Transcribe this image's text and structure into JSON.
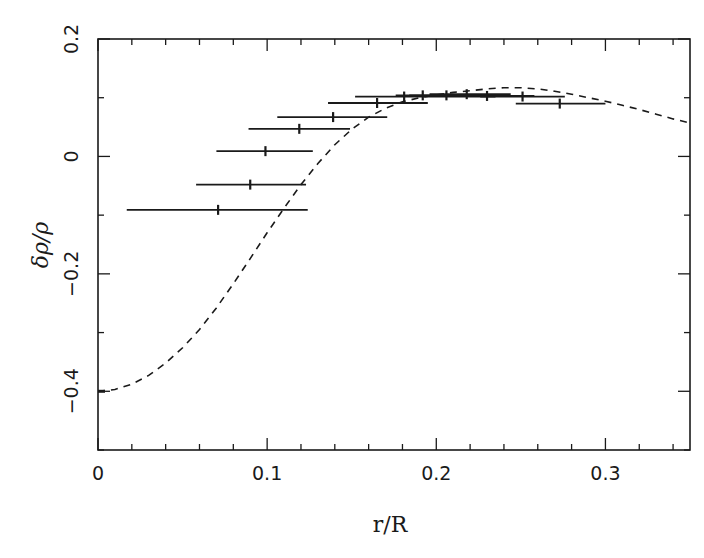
{
  "chart_data": {
    "type": "scatter",
    "title": "",
    "xlabel": "r/R",
    "ylabel": "δρ/ρ",
    "xlim": [
      0,
      0.35
    ],
    "ylim": [
      -0.5,
      0.2
    ],
    "grid": false,
    "legend": null,
    "x_ticks": [
      0,
      0.1,
      0.2,
      0.3
    ],
    "x_tick_labels": [
      "0",
      "0.1",
      "0.2",
      "0.3"
    ],
    "x_minor_step": 0.02,
    "y_ticks": [
      -0.4,
      -0.2,
      0,
      0.2
    ],
    "y_tick_labels": [
      "−0.4",
      "−0.2",
      "0",
      "0.2"
    ],
    "y_minor_step": 0.1,
    "series": [
      {
        "name": "inversion points (horizontal error bars)",
        "kind": "errorbar",
        "color": "#1a1a1a",
        "points": [
          {
            "x": 0.071,
            "y": -0.091,
            "xmin": 0.017,
            "xmax": 0.124
          },
          {
            "x": 0.09,
            "y": -0.048,
            "xmin": 0.058,
            "xmax": 0.123
          },
          {
            "x": 0.099,
            "y": 0.009,
            "xmin": 0.07,
            "xmax": 0.127
          },
          {
            "x": 0.119,
            "y": 0.047,
            "xmin": 0.089,
            "xmax": 0.149
          },
          {
            "x": 0.139,
            "y": 0.067,
            "xmin": 0.106,
            "xmax": 0.171
          },
          {
            "x": 0.165,
            "y": 0.091,
            "xmin": 0.136,
            "xmax": 0.195
          },
          {
            "x": 0.181,
            "y": 0.102,
            "xmin": 0.152,
            "xmax": 0.235
          },
          {
            "x": 0.192,
            "y": 0.104,
            "xmin": 0.176,
            "xmax": 0.222
          },
          {
            "x": 0.206,
            "y": 0.104,
            "xmin": 0.184,
            "xmax": 0.232
          },
          {
            "x": 0.218,
            "y": 0.106,
            "xmin": 0.196,
            "xmax": 0.244
          },
          {
            "x": 0.23,
            "y": 0.103,
            "xmin": 0.208,
            "xmax": 0.258
          },
          {
            "x": 0.251,
            "y": 0.102,
            "xmin": 0.226,
            "xmax": 0.276
          },
          {
            "x": 0.273,
            "y": 0.09,
            "xmin": 0.247,
            "xmax": 0.3
          }
        ]
      },
      {
        "name": "model curve",
        "kind": "line",
        "style": "dashed",
        "color": "#1a1a1a",
        "x": [
          0.0,
          0.01,
          0.02,
          0.03,
          0.04,
          0.05,
          0.06,
          0.07,
          0.08,
          0.09,
          0.1,
          0.11,
          0.12,
          0.13,
          0.14,
          0.15,
          0.16,
          0.17,
          0.18,
          0.19,
          0.2,
          0.21,
          0.22,
          0.23,
          0.24,
          0.25,
          0.26,
          0.27,
          0.28,
          0.29,
          0.3,
          0.31,
          0.32,
          0.33,
          0.34,
          0.35
        ],
        "y": [
          -0.4,
          -0.397,
          -0.388,
          -0.373,
          -0.352,
          -0.326,
          -0.295,
          -0.258,
          -0.217,
          -0.174,
          -0.13,
          -0.088,
          -0.048,
          -0.012,
          0.02,
          0.046,
          0.067,
          0.082,
          0.093,
          0.1,
          0.105,
          0.109,
          0.112,
          0.115,
          0.117,
          0.117,
          0.115,
          0.111,
          0.106,
          0.1,
          0.094,
          0.087,
          0.08,
          0.072,
          0.064,
          0.057
        ]
      }
    ]
  }
}
